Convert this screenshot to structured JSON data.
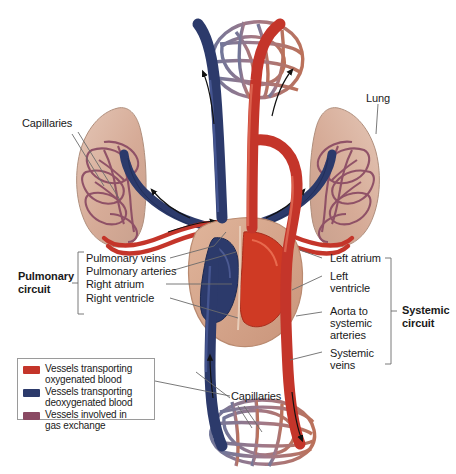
{
  "figure": {
    "background": "#ffffff"
  },
  "colors": {
    "oxygenated": "#c4352a",
    "deoxygenated": "#2c3a6b",
    "gas_exchange": "#8a4a63",
    "lung_tissue": "#d9b5a4",
    "heart_muscle": "#d8a98f",
    "leader_line": "#6b6b6b",
    "legend_border": "#9a9a9a"
  },
  "labels": {
    "capillaries_top_left": "Capillaries",
    "lung": "Lung",
    "capillaries_bottom": "Capillaries",
    "pulmonary_circuit": "Pulmonary\ncircuit",
    "pulmonary_circuit_line1": "Pulmonary",
    "pulmonary_circuit_line2": "circuit",
    "systemic_circuit_line1": "Systemic",
    "systemic_circuit_line2": "circuit"
  },
  "center_labels": [
    {
      "text": "Pulmonary veins"
    },
    {
      "text": "Pulmonary arteries"
    },
    {
      "text": "Right atrium"
    },
    {
      "text": "Right ventricle"
    }
  ],
  "right_labels": [
    {
      "text": "Left atrium"
    },
    {
      "text": "Left"
    },
    {
      "text": "ventricle"
    },
    {
      "text": "Aorta to"
    },
    {
      "text": "systemic"
    },
    {
      "text": "arteries"
    },
    {
      "text": "Systemic"
    },
    {
      "text": "veins"
    }
  ],
  "legend": {
    "items": [
      {
        "swatch": "#c4352a",
        "line1": "Vessels transporting",
        "line2": "oxygenated blood"
      },
      {
        "swatch": "#2c3a6b",
        "line1": "Vessels transporting",
        "line2": "deoxygenated blood"
      },
      {
        "swatch": "#8a4a63",
        "line1": "Vessels involved in",
        "line2": "gas exchange"
      }
    ]
  }
}
